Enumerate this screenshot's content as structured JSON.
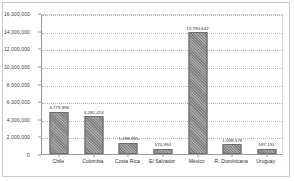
{
  "chart_data": {
    "type": "bar",
    "title": "",
    "subtitle": "",
    "xlabel": "",
    "ylabel": "",
    "ylim": [
      0,
      16000000
    ],
    "ytick_step": 2000000,
    "grid": true,
    "legend": false,
    "legend_position": "none",
    "bar_color": "#808080",
    "bar_pattern": "diagonal-hatch",
    "categories": [
      "Chile",
      "Colombia",
      "Costa Rica",
      "El Salvador",
      "México",
      "R. Dominicana",
      "Uruguay"
    ],
    "values": [
      4775996,
      4281424,
      1298965,
      570994,
      13790642,
      1098579,
      597191
    ],
    "value_labels": [
      "4,775,996",
      "4,281,424",
      "1,298,965",
      "570,994",
      "13,790,642",
      "1,098,579",
      "597,191"
    ],
    "ytick_labels": [
      "0",
      "2,000,000",
      "4,000,000",
      "6,000,000",
      "8,000,000",
      "10,000,000",
      "12,000,000",
      "14,000,000",
      "16,000,000"
    ],
    "ytick_values": [
      0,
      2000000,
      4000000,
      6000000,
      8000000,
      10000000,
      12000000,
      14000000,
      16000000
    ]
  }
}
